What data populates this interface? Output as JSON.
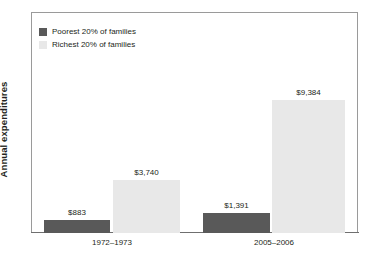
{
  "chart_data": {
    "type": "bar",
    "title": "",
    "subtitle": "",
    "xlabel": "",
    "ylabel": "Annual expenditures",
    "categories": [
      "1972–1973",
      "2005–2006"
    ],
    "series": [
      {
        "name": "Poorest 20% of families",
        "color": "#595959",
        "values": [
          883,
          1391
        ],
        "labels": [
          "$883",
          "$1,391"
        ]
      },
      {
        "name": "Richest 20% of families",
        "color": "#e8e8e8",
        "values": [
          3740,
          9384
        ],
        "labels": [
          "$3,740",
          "$9,384"
        ]
      }
    ],
    "ylim": [
      0,
      15600
    ],
    "y_ticks": [],
    "y_tick_labels": [],
    "grid": false,
    "legend_position": "top-left",
    "value_labels_shown": true
  },
  "axes": {
    "y_title": "Annual expenditures"
  },
  "legend": {
    "entries": [
      {
        "label": "Poorest 20% of families",
        "swatch_color": "#595959"
      },
      {
        "label": "Richest 20% of families",
        "swatch_color": "#e8e8e8"
      }
    ]
  },
  "categories": [
    {
      "label": "1972–1973"
    },
    {
      "label": "2005–2006"
    }
  ],
  "bars": [
    {
      "name": "poorest-1972-1973",
      "label": "$883",
      "series": "Poorest 20% of families",
      "category": "1972–1973",
      "value": 883
    },
    {
      "name": "richest-1972-1973",
      "label": "$3,740",
      "series": "Richest 20% of families",
      "category": "1972–1973",
      "value": 3740
    },
    {
      "name": "poorest-2005-2006",
      "label": "$1,391",
      "series": "Poorest 20% of families",
      "category": "2005–2006",
      "value": 1391
    },
    {
      "name": "richest-2005-2006",
      "label": "$9,384",
      "series": "Richest 20% of families",
      "category": "2005–2006",
      "value": 9384
    }
  ],
  "colors": {
    "poorest": "#595959",
    "richest": "#e8e8e8",
    "frame": "#9a9a9a",
    "axis": "#6f6f6f",
    "text": "#231f20",
    "background": "#ffffff"
  }
}
